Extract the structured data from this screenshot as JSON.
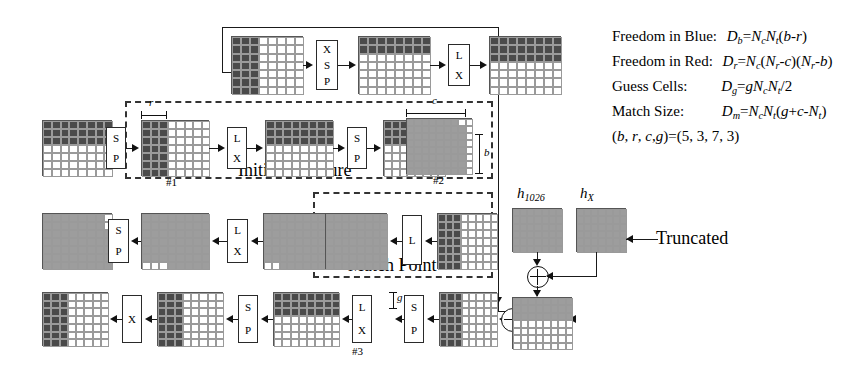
{
  "figure": {
    "type": "cryptanalysis-state-diagram",
    "labels": {
      "initial_structure": "Initial Structure",
      "match_point": "Match Point",
      "truncated": "Truncated",
      "node1": "#1",
      "node2": "#2",
      "node3": "#3",
      "dim_r": "r",
      "dim_c": "c",
      "dim_b": "b",
      "dim_g": "g",
      "h_1026_base": "h",
      "h_1026_sub": "1026",
      "h_x_base": "h",
      "h_x_sub": "X"
    },
    "operations": {
      "SP": [
        "S",
        "P"
      ],
      "LX": [
        "L",
        "X"
      ],
      "XSP": [
        "X",
        "S",
        "P"
      ],
      "L": [
        "L"
      ],
      "X": [
        "X"
      ]
    }
  },
  "equations": [
    {
      "name": "Freedom in Blue:",
      "expr": "D_b = N_c N_t (b-r)"
    },
    {
      "name": "Freedom in Red:",
      "expr": "D_r = N_c (N_r-c)(N_r-b)"
    },
    {
      "name": "Guess Cells:",
      "expr": "D_g = g N_c N_t /2"
    },
    {
      "name": "Match Size:",
      "expr": "D_m = N_c N_t (g+c-N_t)"
    }
  ],
  "parameters": {
    "line": "(b, r, c, g) = (5, 3, 7, 3)",
    "symbols": "(b, r, c,g)",
    "equals": "=",
    "values": "(5, 3, 7, 3)",
    "b": 5,
    "r": 3,
    "c": 7,
    "g": 3
  },
  "colors": {
    "dark": "#4a4a4a",
    "gray": "#9d9d9d",
    "light": "#f4f4f4",
    "white": "#ffffff",
    "stroke": "#1a1a1a"
  },
  "rows": [
    {
      "name": "row-top",
      "matrices": [
        "left-dark-cols",
        "top-dark-rows",
        "top-dark-rows-tall"
      ],
      "ops": [
        "XSP",
        "LX"
      ]
    },
    {
      "name": "row-initial-structure",
      "matrices": [
        "top-dark-rows",
        "node1-left-cols",
        "top-dark-rows",
        "left-dark-cols",
        "node2-all-gray"
      ],
      "ops": [
        "SP",
        "LX",
        "SP",
        "LX"
      ]
    },
    {
      "name": "row-match-point",
      "matrices": [
        "gray-notch-right",
        "gray-notch-bottom",
        "gray-notch-bottom2",
        "match-gray",
        "left-dark-cols"
      ],
      "ops": [
        "SP",
        "LX",
        "SP",
        "L"
      ]
    },
    {
      "name": "row-bottom",
      "matrices": [
        "left-dark-cols",
        "left-dark-cols",
        "top-dark-rows",
        "node3-top-dark",
        "left-dark-cols-sm"
      ],
      "ops": [
        "X",
        "SP",
        "LX",
        "SP"
      ]
    }
  ]
}
